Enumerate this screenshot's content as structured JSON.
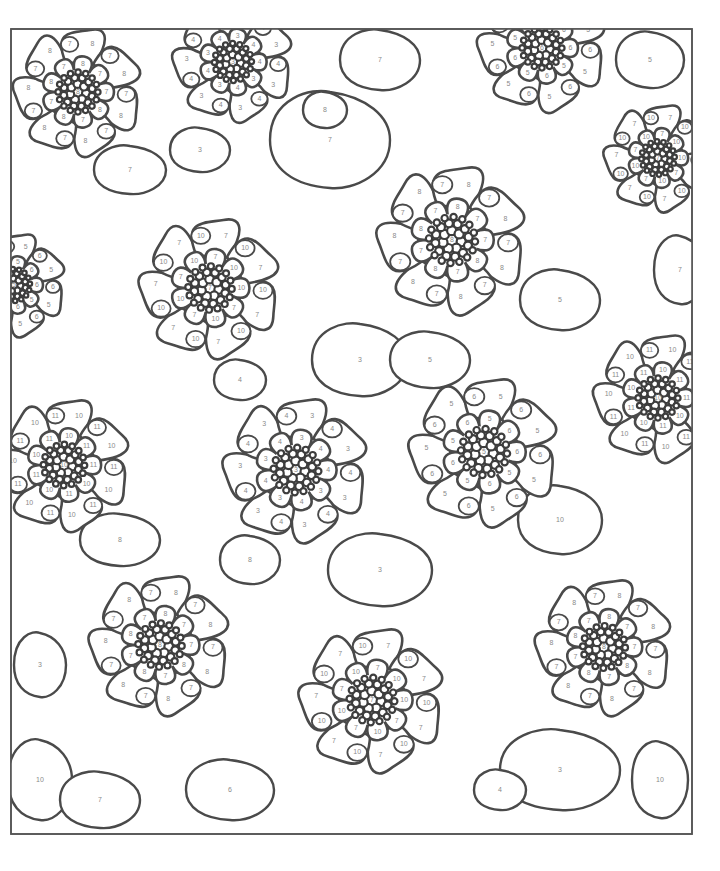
{
  "page": {
    "frame": {
      "x": 11,
      "y": 29,
      "width": 681,
      "height": 805
    },
    "line_color": "#4a4a4a",
    "number_color": "#8a8a8a"
  },
  "flowers": [
    {
      "id": "f1",
      "cx": 78,
      "cy": 92,
      "r": 62,
      "center_num": "8",
      "petal_num": "8",
      "accent_num": "7"
    },
    {
      "id": "f2",
      "cx": 233,
      "cy": 62,
      "r": 58,
      "center_num": "3",
      "petal_num": "3",
      "accent_num": "4"
    },
    {
      "id": "f3",
      "cx": 542,
      "cy": 48,
      "r": 62,
      "center_num": "6",
      "petal_num": "5",
      "accent_num": "6"
    },
    {
      "id": "f4",
      "cx": 658,
      "cy": 158,
      "r": 52,
      "center_num": "7",
      "petal_num": "7",
      "accent_num": "10"
    },
    {
      "id": "f5",
      "cx": 452,
      "cy": 240,
      "r": 72,
      "center_num": "8",
      "petal_num": "8",
      "accent_num": "7"
    },
    {
      "id": "f6",
      "cx": 210,
      "cy": 288,
      "r": 68,
      "center_num": "7",
      "petal_num": "7",
      "accent_num": "10"
    },
    {
      "id": "f7",
      "cx": 14,
      "cy": 285,
      "r": 50,
      "center_num": "5",
      "petal_num": "5",
      "accent_num": "6"
    },
    {
      "id": "f8",
      "cx": 658,
      "cy": 398,
      "r": 62,
      "center_num": "10",
      "petal_num": "10",
      "accent_num": "11"
    },
    {
      "id": "f9",
      "cx": 64,
      "cy": 465,
      "r": 64,
      "center_num": "10",
      "petal_num": "10",
      "accent_num": "11"
    },
    {
      "id": "f10",
      "cx": 296,
      "cy": 470,
      "r": 70,
      "center_num": "3",
      "petal_num": "3",
      "accent_num": "4"
    },
    {
      "id": "f11",
      "cx": 484,
      "cy": 452,
      "r": 72,
      "center_num": "5",
      "petal_num": "5",
      "accent_num": "6"
    },
    {
      "id": "f12",
      "cx": 160,
      "cy": 645,
      "r": 68,
      "center_num": "8",
      "petal_num": "8",
      "accent_num": "7"
    },
    {
      "id": "f13",
      "cx": 372,
      "cy": 700,
      "r": 70,
      "center_num": "7",
      "petal_num": "7",
      "accent_num": "10"
    },
    {
      "id": "f14",
      "cx": 604,
      "cy": 647,
      "r": 66,
      "center_num": "8",
      "petal_num": "8",
      "accent_num": "7"
    }
  ],
  "fillers": [
    {
      "cx": 330,
      "cy": 140,
      "rx": 60,
      "ry": 48,
      "num": "7"
    },
    {
      "cx": 325,
      "cy": 110,
      "rx": 22,
      "ry": 18,
      "num": "8"
    },
    {
      "cx": 560,
      "cy": 300,
      "rx": 40,
      "ry": 30,
      "num": "5"
    },
    {
      "cx": 360,
      "cy": 360,
      "rx": 48,
      "ry": 36,
      "num": "3"
    },
    {
      "cx": 240,
      "cy": 380,
      "rx": 26,
      "ry": 20,
      "num": "4"
    },
    {
      "cx": 430,
      "cy": 360,
      "rx": 40,
      "ry": 28,
      "num": "5"
    },
    {
      "cx": 560,
      "cy": 520,
      "rx": 42,
      "ry": 34,
      "num": "10"
    },
    {
      "cx": 120,
      "cy": 540,
      "rx": 40,
      "ry": 26,
      "num": "8"
    },
    {
      "cx": 380,
      "cy": 570,
      "rx": 52,
      "ry": 36,
      "num": "3"
    },
    {
      "cx": 250,
      "cy": 560,
      "rx": 30,
      "ry": 24,
      "num": "8"
    },
    {
      "cx": 560,
      "cy": 770,
      "rx": 60,
      "ry": 40,
      "num": "3"
    },
    {
      "cx": 500,
      "cy": 790,
      "rx": 26,
      "ry": 20,
      "num": "4"
    },
    {
      "cx": 660,
      "cy": 780,
      "rx": 28,
      "ry": 38,
      "num": "10"
    },
    {
      "cx": 40,
      "cy": 780,
      "rx": 32,
      "ry": 40,
      "num": "10"
    },
    {
      "cx": 100,
      "cy": 800,
      "rx": 40,
      "ry": 28,
      "num": "7"
    },
    {
      "cx": 230,
      "cy": 790,
      "rx": 44,
      "ry": 30,
      "num": "6"
    },
    {
      "cx": 680,
      "cy": 270,
      "rx": 26,
      "ry": 34,
      "num": "7"
    },
    {
      "cx": 40,
      "cy": 665,
      "rx": 26,
      "ry": 32,
      "num": "3"
    },
    {
      "cx": 130,
      "cy": 170,
      "rx": 36,
      "ry": 24,
      "num": "7"
    },
    {
      "cx": 380,
      "cy": 60,
      "rx": 40,
      "ry": 30,
      "num": "7"
    },
    {
      "cx": 650,
      "cy": 60,
      "rx": 34,
      "ry": 28,
      "num": "5"
    },
    {
      "cx": 200,
      "cy": 150,
      "rx": 30,
      "ry": 22,
      "num": "3"
    }
  ]
}
